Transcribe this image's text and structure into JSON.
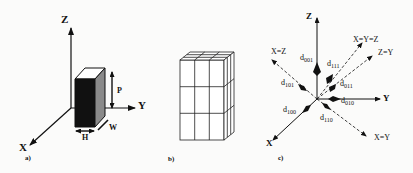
{
  "figure": {
    "panels": [
      {
        "id": "a",
        "label": "a)",
        "axes": {
          "z": "Z",
          "y": "Y",
          "x": "X"
        },
        "dimensions": {
          "height_label": "P",
          "depth_label": "W",
          "width_label": "H"
        }
      },
      {
        "id": "b",
        "label": "b)",
        "description": "3x3 grid subdivided box"
      },
      {
        "id": "c",
        "label": "c)",
        "axes": {
          "z": "Z",
          "y": "Y",
          "x": "X"
        },
        "diagonals": {
          "xz": "X=Z",
          "xyz": "X=Y=Z",
          "zy": "Z=Y",
          "xy": "X=Y"
        },
        "directions": [
          {
            "name": "d",
            "sub": "001"
          },
          {
            "name": "d",
            "sub": "111"
          },
          {
            "name": "d",
            "sub": "101"
          },
          {
            "name": "d",
            "sub": "011"
          },
          {
            "name": "d",
            "sub": "010"
          },
          {
            "name": "d",
            "sub": "100"
          },
          {
            "name": "d",
            "sub": "110"
          }
        ]
      }
    ]
  }
}
